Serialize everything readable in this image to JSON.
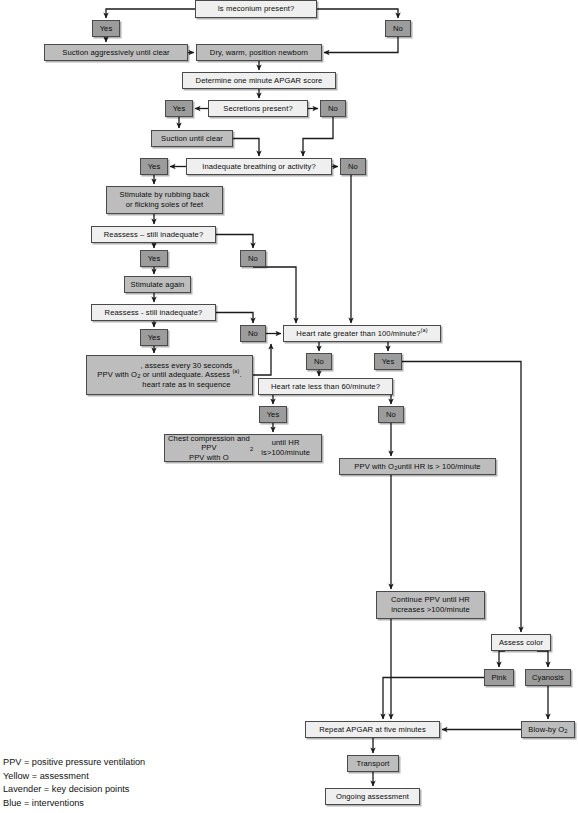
{
  "chart_data": {
    "type": "diagram",
    "nodes": [
      {
        "id": "meconium",
        "label": "Is meconium present?",
        "role": "assessment",
        "x": 195,
        "y": 0,
        "w": 122,
        "h": 18
      },
      {
        "id": "mec-yes",
        "label": "Yes",
        "role": "decision",
        "x": 92,
        "y": 20,
        "w": 28,
        "h": 17
      },
      {
        "id": "mec-no",
        "label": "No",
        "role": "decision",
        "x": 385,
        "y": 20,
        "w": 26,
        "h": 17
      },
      {
        "id": "suction-aggr",
        "label": "Suction aggressively until clear",
        "role": "intervention",
        "x": 44,
        "y": 44,
        "w": 144,
        "h": 17
      },
      {
        "id": "dry-warm",
        "label": "Dry, warm, position newborn",
        "role": "intervention",
        "x": 196,
        "y": 44,
        "w": 126,
        "h": 17
      },
      {
        "id": "apgar-one",
        "label": "Determine one minute APGAR score",
        "role": "assessment",
        "x": 182,
        "y": 72,
        "w": 154,
        "h": 17
      },
      {
        "id": "secretions",
        "label": "Secretions present?",
        "role": "assessment",
        "x": 208,
        "y": 100,
        "w": 100,
        "h": 17
      },
      {
        "id": "sec-yes",
        "label": "Yes",
        "role": "decision",
        "x": 165,
        "y": 100,
        "w": 28,
        "h": 17
      },
      {
        "id": "sec-no",
        "label": "No",
        "role": "decision",
        "x": 320,
        "y": 100,
        "w": 26,
        "h": 17
      },
      {
        "id": "suction-clear",
        "label": "Suction until clear",
        "role": "intervention",
        "x": 151,
        "y": 130,
        "w": 82,
        "h": 17
      },
      {
        "id": "inadequate",
        "label": "Inadequate breathing or activity?",
        "role": "assessment",
        "x": 186,
        "y": 158,
        "w": 146,
        "h": 17
      },
      {
        "id": "inad-yes",
        "label": "Yes",
        "role": "decision",
        "x": 140,
        "y": 158,
        "w": 28,
        "h": 17
      },
      {
        "id": "inad-no",
        "label": "No",
        "role": "decision",
        "x": 340,
        "y": 158,
        "w": 26,
        "h": 17
      },
      {
        "id": "stimulate",
        "label": "Stimulate by rubbing back\nor flicking soles of feet",
        "role": "intervention",
        "x": 106,
        "y": 186,
        "w": 117,
        "h": 28
      },
      {
        "id": "reassess1",
        "label": "Reassess – still inadequate?",
        "role": "assessment",
        "x": 91,
        "y": 226,
        "w": 125,
        "h": 17
      },
      {
        "id": "re1-yes",
        "label": "Yes",
        "role": "decision",
        "x": 140,
        "y": 250,
        "w": 28,
        "h": 17
      },
      {
        "id": "re1-no",
        "label": "No",
        "role": "decision",
        "x": 240,
        "y": 250,
        "w": 26,
        "h": 17
      },
      {
        "id": "stim-again",
        "label": "Stimulate again",
        "role": "intervention",
        "x": 124,
        "y": 276,
        "w": 67,
        "h": 17
      },
      {
        "id": "reassess2",
        "label": "Reassess - still inadequate?",
        "role": "assessment",
        "x": 91,
        "y": 304,
        "w": 125,
        "h": 17
      },
      {
        "id": "re2-no",
        "label": "No",
        "role": "decision",
        "x": 240,
        "y": 325,
        "w": 26,
        "h": 17
      },
      {
        "id": "re2-yes",
        "label": "Yes",
        "role": "decision",
        "x": 140,
        "y": 329,
        "w": 28,
        "h": 17
      },
      {
        "id": "hr100",
        "label": "Heart rate greater than 100/minute?",
        "label_sup": "(a)",
        "role": "assessment",
        "x": 283,
        "y": 325,
        "w": 158,
        "h": 17
      },
      {
        "id": "ppv-assess",
        "label": "PPV with O2, assess every 30 seconds\nor until adequate. Assess\nheart rate as in sequence (a).",
        "role": "intervention",
        "x": 86,
        "y": 355,
        "w": 167,
        "h": 40
      },
      {
        "id": "hr100-no",
        "label": "No",
        "role": "decision",
        "x": 306,
        "y": 353,
        "w": 26,
        "h": 17
      },
      {
        "id": "hr100-yes",
        "label": "Yes",
        "role": "decision",
        "x": 374,
        "y": 353,
        "w": 28,
        "h": 17
      },
      {
        "id": "hr60",
        "label": "Heart rate less than 60/minute?",
        "role": "assessment",
        "x": 258,
        "y": 378,
        "w": 135,
        "h": 17
      },
      {
        "id": "hr60-yes",
        "label": "Yes",
        "role": "decision",
        "x": 259,
        "y": 406,
        "w": 28,
        "h": 17
      },
      {
        "id": "hr60-no",
        "label": "No",
        "role": "decision",
        "x": 378,
        "y": 406,
        "w": 26,
        "h": 17
      },
      {
        "id": "chest-comp",
        "label": "Chest compression and PPV\nPPV with O2 until HR is>100/minute",
        "role": "intervention",
        "x": 164,
        "y": 434,
        "w": 158,
        "h": 28
      },
      {
        "id": "ppv-until",
        "label": "PPV with O2 until HR is > 100/minute",
        "role": "intervention",
        "x": 339,
        "y": 458,
        "w": 157,
        "h": 17
      },
      {
        "id": "continue-ppv",
        "label": "Continue PPV until HR\nincreases >100/minute",
        "role": "intervention",
        "x": 376,
        "y": 591,
        "w": 109,
        "h": 28
      },
      {
        "id": "assess-color",
        "label": "Assess color",
        "role": "assessment",
        "x": 491,
        "y": 634,
        "w": 60,
        "h": 17
      },
      {
        "id": "pink",
        "label": "Pink",
        "role": "decision",
        "x": 484,
        "y": 669,
        "w": 30,
        "h": 17
      },
      {
        "id": "cyanosis",
        "label": "Cyanosis",
        "role": "decision",
        "x": 525,
        "y": 669,
        "w": 46,
        "h": 17
      },
      {
        "id": "blowby",
        "label": "Blow-by O2",
        "role": "intervention",
        "x": 521,
        "y": 721,
        "w": 54,
        "h": 17
      },
      {
        "id": "repeat-apgar",
        "label": "Repeat APGAR at five minutes",
        "role": "assessment",
        "x": 305,
        "y": 721,
        "w": 135,
        "h": 17
      },
      {
        "id": "transport",
        "label": "Transport",
        "role": "intervention",
        "x": 347,
        "y": 755,
        "w": 52,
        "h": 17
      },
      {
        "id": "ongoing",
        "label": "Ongoing assessment",
        "role": "assessment",
        "x": 325,
        "y": 788,
        "w": 95,
        "h": 17
      }
    ]
  },
  "legend": {
    "lines": [
      "PPV = positive pressure ventilation",
      "Yellow = assessment",
      "Lavender = key decision points",
      "Blue = interventions"
    ]
  },
  "colors": {
    "assessment": "#efefef",
    "decision": "#9c9c9c",
    "intervention": "#bdbdbd",
    "edge": "#1a1a1a",
    "border": "#4a4a4a"
  }
}
